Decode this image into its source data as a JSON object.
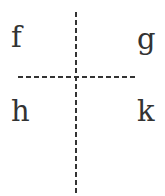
{
  "diagram": {
    "quadrant_labels": {
      "top_left": "f",
      "top_right": "g",
      "bottom_left": "h",
      "bottom_right": "k"
    },
    "lines": {
      "vertical": {
        "style": "dashed",
        "x": 76,
        "y1": 12,
        "y2": 196
      },
      "horizontal": {
        "style": "dashed",
        "y": 77,
        "x1": 18,
        "x2": 137
      }
    },
    "colors": {
      "line": "#333333",
      "text": "#333333",
      "background": "#ffffff"
    }
  }
}
